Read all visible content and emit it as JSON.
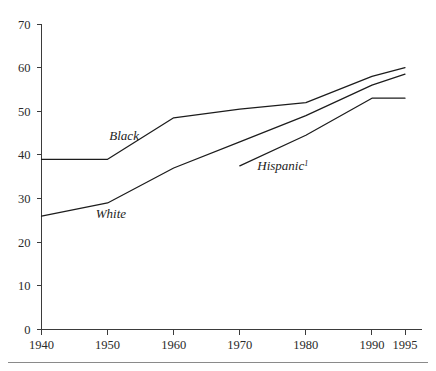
{
  "chart_data": {
    "type": "line",
    "title": "",
    "subtitle": "",
    "xlabel": "",
    "ylabel": "",
    "x": [
      1940,
      1950,
      1960,
      1970,
      1980,
      1990,
      1995
    ],
    "xtick_labels": [
      "1940",
      "1950",
      "1960",
      "1970",
      "1980",
      "1990",
      "1995"
    ],
    "ytick_labels": [
      "0",
      "10",
      "20",
      "30",
      "40",
      "50",
      "60",
      "70"
    ],
    "ytick_values": [
      0,
      10,
      20,
      30,
      40,
      50,
      60,
      70
    ],
    "xlim": [
      1940,
      1995
    ],
    "ylim": [
      0,
      70
    ],
    "grid": false,
    "legend_position": "inline-annotations",
    "series": [
      {
        "name": "Black",
        "label": "Black",
        "label_sup": "",
        "x": [
          1940,
          1950,
          1960,
          1970,
          1980,
          1990,
          1995
        ],
        "values": [
          39,
          39,
          48.5,
          50.5,
          52,
          58,
          60
        ],
        "label_x": 1952.5,
        "label_y": 43.5
      },
      {
        "name": "White",
        "label": "White",
        "label_sup": "",
        "x": [
          1940,
          1950,
          1960,
          1970,
          1980,
          1990,
          1995
        ],
        "values": [
          26,
          29,
          37,
          43,
          49,
          56,
          58.5
        ],
        "label_x": 1950.5,
        "label_y": 25.5
      },
      {
        "name": "Hispanic",
        "label": "Hispanic",
        "label_sup": "1",
        "x": [
          1970,
          1980,
          1990,
          1995
        ],
        "values": [
          37.5,
          44.5,
          53,
          53
        ],
        "label_x": 1976.5,
        "label_y": 36.5
      }
    ]
  },
  "axes": {
    "y_axis_name": "y-axis",
    "x_axis_name": "x-axis"
  },
  "footnote": {
    "marker": "1"
  }
}
